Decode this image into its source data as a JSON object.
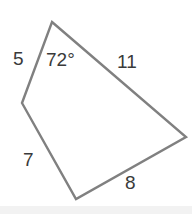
{
  "figure": {
    "kind": "geometry-quadrilateral",
    "background_color": "#ffffff",
    "stroke_color": "#808080",
    "stroke_width": 2.4,
    "text_color": "#3a3a3a",
    "vertices": [
      {
        "name": "top",
        "x": 52,
        "y": 22
      },
      {
        "name": "right",
        "x": 186,
        "y": 137
      },
      {
        "name": "bottom",
        "x": 76,
        "y": 199
      },
      {
        "name": "left",
        "x": 22,
        "y": 103
      }
    ],
    "sides": [
      {
        "name": "side-11",
        "from": "top",
        "to": "right",
        "label": "11"
      },
      {
        "name": "side-8",
        "from": "right",
        "to": "bottom",
        "label": "8"
      },
      {
        "name": "side-7",
        "from": "bottom",
        "to": "left",
        "label": "7"
      },
      {
        "name": "side-5",
        "from": "left",
        "to": "top",
        "label": "5"
      }
    ],
    "angles": [
      {
        "name": "angle-top",
        "at": "top",
        "label": "72°"
      }
    ]
  }
}
